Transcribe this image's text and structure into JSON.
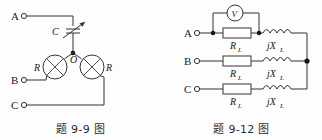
{
  "page": {
    "background_color": "#fdfdfd",
    "line_color": "#333333"
  },
  "figures": [
    {
      "id": "figure-9-9",
      "caption": "题 9-9 图",
      "terminals": [
        {
          "name": "A",
          "label": "A"
        },
        {
          "name": "B",
          "label": "B"
        },
        {
          "name": "C",
          "label": "C"
        }
      ],
      "components": [
        {
          "type": "variable-capacitor",
          "label": "C"
        },
        {
          "type": "lamp",
          "label": "R",
          "position": "left"
        },
        {
          "type": "lamp",
          "label": "R",
          "position": "right"
        }
      ],
      "nodes": [
        {
          "name": "neutral-node",
          "label": "O"
        }
      ]
    },
    {
      "id": "figure-9-12",
      "caption": "题 9-12 图",
      "terminals": [
        {
          "name": "A",
          "label": "A"
        },
        {
          "name": "B",
          "label": "B"
        },
        {
          "name": "C",
          "label": "C"
        }
      ],
      "meter": {
        "type": "voltmeter",
        "label": "V"
      },
      "branches": [
        {
          "phase": "A",
          "resistor": {
            "main": "R",
            "sub": "L"
          },
          "inductor": {
            "main": "jX",
            "sub": "L"
          }
        },
        {
          "phase": "B",
          "resistor": {
            "main": "R",
            "sub": "L"
          },
          "inductor": {
            "main": "jX",
            "sub": "L"
          }
        },
        {
          "phase": "C",
          "resistor": {
            "main": "R",
            "sub": "L"
          },
          "inductor": {
            "main": "jX",
            "sub": "L"
          }
        }
      ]
    }
  ]
}
